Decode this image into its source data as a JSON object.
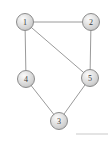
{
  "figure": {
    "kind": "undirected-graph-diagram",
    "background_color": "#ffffff",
    "width": 111,
    "height": 142
  },
  "graph": {
    "nodes": [
      {
        "id": "1",
        "label": "1",
        "cx": 25,
        "cy": 22,
        "r": 8.5
      },
      {
        "id": "2",
        "label": "2",
        "cx": 91,
        "cy": 22,
        "r": 8.5
      },
      {
        "id": "3",
        "label": "3",
        "cx": 59,
        "cy": 121,
        "r": 8.5
      },
      {
        "id": "4",
        "label": "4",
        "cx": 26,
        "cy": 79,
        "r": 8.5
      },
      {
        "id": "5",
        "label": "5",
        "cx": 90,
        "cy": 78,
        "r": 8.5
      }
    ],
    "edges": [
      {
        "id": "e-1-2",
        "from": "1",
        "to": "2"
      },
      {
        "id": "e-1-4",
        "from": "1",
        "to": "4"
      },
      {
        "id": "e-1-5",
        "from": "1",
        "to": "5"
      },
      {
        "id": "e-2-5",
        "from": "2",
        "to": "5"
      },
      {
        "id": "e-4-3",
        "from": "4",
        "to": "3"
      },
      {
        "id": "e-3-5",
        "from": "3",
        "to": "5"
      }
    ],
    "style": {
      "node_fill_light": "#f2f2f2",
      "node_fill_mid": "#d6d6d6",
      "node_fill_dark": "#a8a8a8",
      "node_stroke": "#8c8c8c",
      "node_label_color": "#3a3a3a",
      "edge_color": "#9a9a9a",
      "edge_width": 1
    }
  },
  "artifacts": {
    "bottom_rule": {
      "name": "bottom-right-rule",
      "x1": 76,
      "y1": 134,
      "x2": 108,
      "y2": 134,
      "color": "#d9d9d9"
    }
  }
}
